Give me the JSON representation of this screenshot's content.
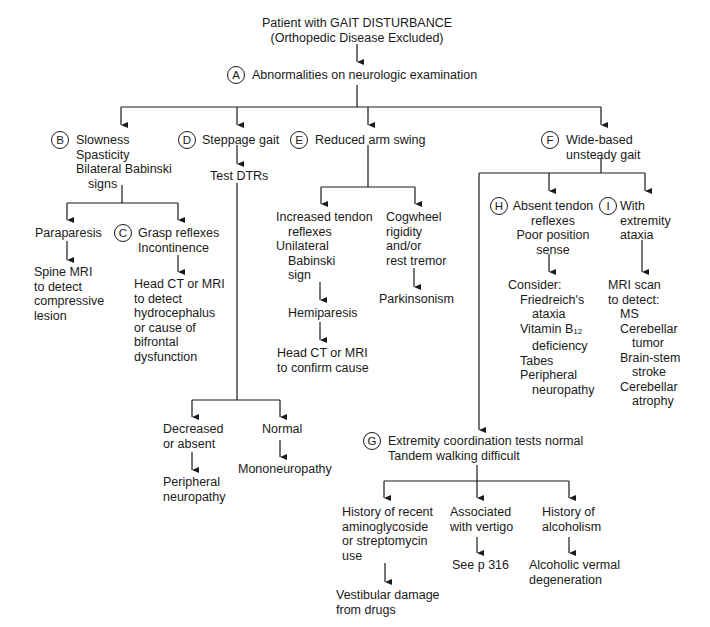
{
  "diagram": {
    "type": "clinical-decision-flowchart",
    "root": {
      "line1": "Patient with GAIT DISTURBANCE",
      "line2": "(Orthopedic Disease Excluded)"
    },
    "A": {
      "badge": "A",
      "text": "Abnormalities on neurologic examination"
    },
    "B": {
      "badge": "B",
      "lines": [
        "Slowness",
        "Spasticity",
        "Bilateral Babinski",
        "signs"
      ],
      "paraparesis": "Paraparesis",
      "spine_mri": [
        "Spine MRI",
        "to detect",
        "compressive",
        "lesion"
      ]
    },
    "C": {
      "badge": "C",
      "lines": [
        "Grasp reflexes",
        "Incontinence"
      ],
      "result": [
        "Head CT or MRI",
        "to detect",
        "hydrocephalus",
        "or cause of",
        "bifrontal",
        "dysfunction"
      ]
    },
    "D": {
      "badge": "D",
      "text": "Steppage gait",
      "test": "Test DTRs",
      "decreased": [
        "Decreased",
        "or absent"
      ],
      "peripheral": [
        "Peripheral",
        "neuropathy"
      ],
      "normal": "Normal",
      "mononeuropathy": "Mononeuropathy"
    },
    "E": {
      "badge": "E",
      "text": "Reduced arm swing",
      "left": [
        "Increased tendon",
        "reflexes",
        "Unilateral",
        "Babinski",
        "sign"
      ],
      "hemiparesis": "Hemiparesis",
      "head_ct": [
        "Head CT or MRI",
        "to confirm cause"
      ],
      "right": [
        "Cogwheel",
        "rigidity",
        "and/or",
        "rest tremor"
      ],
      "parkinsonism": "Parkinsonism"
    },
    "F": {
      "badge": "F",
      "lines": [
        "Wide-based",
        "unsteady gait"
      ]
    },
    "H": {
      "badge": "H",
      "lines": [
        "Absent tendon",
        "reflexes",
        "Poor position",
        "sense"
      ],
      "consider_title": "Consider:",
      "consider": [
        "Friedreich's",
        "ataxia",
        "Vitamin B",
        "deficiency",
        "Tabes",
        "Peripheral",
        "neuropathy"
      ],
      "b12_sub": "12"
    },
    "I": {
      "badge": "I",
      "lines": [
        "With",
        "extremity",
        "ataxia"
      ],
      "mri_title": [
        "MRI scan",
        "to detect:"
      ],
      "mri": [
        "MS",
        "Cerebellar",
        "tumor",
        "Brain-stem",
        "stroke",
        "Cerebellar",
        "atrophy"
      ]
    },
    "G": {
      "badge": "G",
      "lines": [
        "Extremity coordination tests normal",
        "Tandem walking difficult"
      ],
      "drug": [
        "History of recent",
        "aminoglycoside",
        "or streptomycin",
        "use"
      ],
      "drug_result": [
        "Vestibular damage",
        "from drugs"
      ],
      "vertigo": [
        "Associated",
        "with vertigo"
      ],
      "vertigo_result": "See p 316",
      "alcohol": [
        "History of",
        "alcoholism"
      ],
      "alcohol_result": [
        "Alcoholic vermal",
        "degeneration"
      ]
    }
  },
  "colors": {
    "ink": "#1a1a1a",
    "background": "#ffffff"
  }
}
